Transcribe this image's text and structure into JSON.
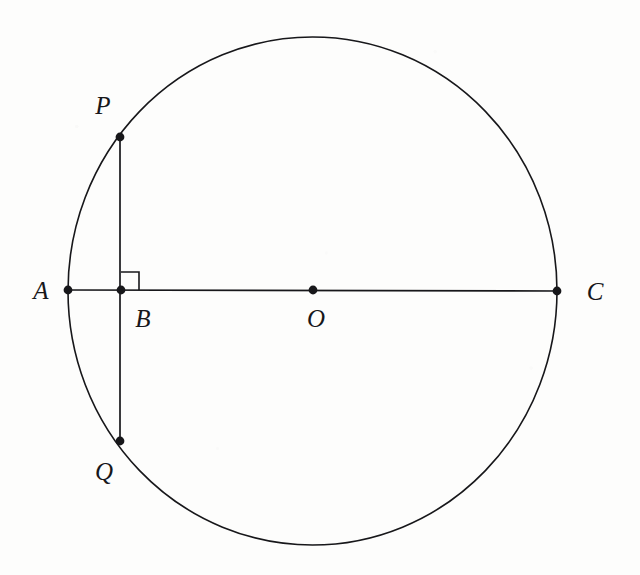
{
  "figure": {
    "type": "geometry-diagram",
    "width": 640,
    "height": 575,
    "background_color": "#fdfdfc",
    "stroke_color": "#17171a",
    "stroke_width": 1.6,
    "point_radius": 4.4
  },
  "circle": {
    "name": "circle-O",
    "center_x": 312.5,
    "center_y": 291,
    "radius_x": 244.5,
    "radius_y": 254
  },
  "points": [
    {
      "id": "A",
      "label": "A",
      "x": 68,
      "y": 290,
      "dot": true,
      "label_x": 41,
      "label_y": 290
    },
    {
      "id": "B",
      "label": "B",
      "x": 121,
      "y": 290,
      "dot": true,
      "label_x": 143,
      "label_y": 318
    },
    {
      "id": "C",
      "label": "C",
      "x": 557,
      "y": 291,
      "dot": true,
      "label_x": 595,
      "label_y": 291
    },
    {
      "id": "O",
      "label": "O",
      "x": 313,
      "y": 290,
      "dot": true,
      "label_x": 316,
      "label_y": 318
    },
    {
      "id": "P",
      "label": "P",
      "x": 120,
      "y": 137,
      "dot": true,
      "label_x": 103,
      "label_y": 105
    },
    {
      "id": "Q",
      "label": "Q",
      "x": 120,
      "y": 441,
      "dot": true,
      "label_x": 104,
      "label_y": 471
    }
  ],
  "segments": [
    {
      "id": "AC",
      "name": "diameter-AC",
      "x1": 68,
      "y1": 290,
      "x2": 557,
      "y2": 291
    },
    {
      "id": "PQ",
      "name": "chord-PQ",
      "x1": 120,
      "y1": 137,
      "x2": 120,
      "y2": 441
    }
  ],
  "right_angle": {
    "name": "right-angle-at-B",
    "vertex_x": 121,
    "vertex_y": 290,
    "size": 18,
    "direction_x": 1,
    "direction_y": -1,
    "points": "121,272 139,272 139,290"
  },
  "chart_data": {
    "type": "scatter",
    "xlabel": "",
    "ylabel": "",
    "categories": [
      "A",
      "B",
      "C",
      "O",
      "P",
      "Q"
    ],
    "x": [
      68,
      121,
      557,
      313,
      120,
      120
    ],
    "y": [
      290,
      290,
      291,
      290,
      137,
      441
    ],
    "annotations": [
      "PQ is perpendicular to AC at B",
      "AC is a diameter through center O",
      "P and Q lie on the circle"
    ]
  }
}
